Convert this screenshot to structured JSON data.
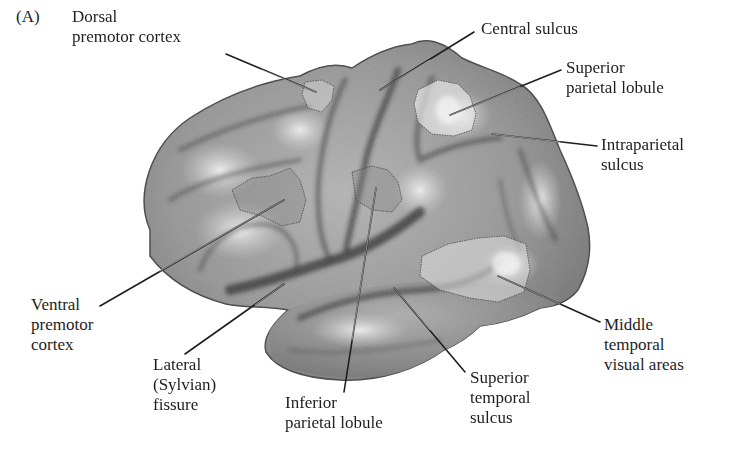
{
  "figure": {
    "panel_label": "(A)",
    "colors": {
      "background": "#ffffff",
      "cortex_base": "#8c8c8c",
      "cortex_highlight": "#e6e6e6",
      "sulcus_shadow": "#3a3a3a",
      "leader_line": "#1e1e1e",
      "text": "#1e1e1e"
    }
  },
  "labels": [
    {
      "id": "dorsal-premotor-cortex",
      "lines": [
        "Dorsal",
        "premotor cortex"
      ]
    },
    {
      "id": "central-sulcus",
      "lines": [
        "Central sulcus"
      ]
    },
    {
      "id": "superior-parietal-lobule",
      "lines": [
        "Superior",
        "parietal lobule"
      ]
    },
    {
      "id": "intraparietal-sulcus",
      "lines": [
        "Intraparietal",
        "sulcus"
      ]
    },
    {
      "id": "ventral-premotor-cortex",
      "lines": [
        "Ventral",
        "premotor",
        "cortex"
      ]
    },
    {
      "id": "lateral-sylvian-fissure",
      "lines": [
        "Lateral",
        "(Sylvian)",
        "fissure"
      ]
    },
    {
      "id": "inferior-parietal-lobule",
      "lines": [
        "Inferior",
        "parietal lobule"
      ]
    },
    {
      "id": "superior-temporal-sulcus",
      "lines": [
        "Superior",
        "temporal",
        "sulcus"
      ]
    },
    {
      "id": "middle-temporal-visual-areas",
      "lines": [
        "Middle",
        "temporal",
        "visual areas"
      ]
    }
  ]
}
